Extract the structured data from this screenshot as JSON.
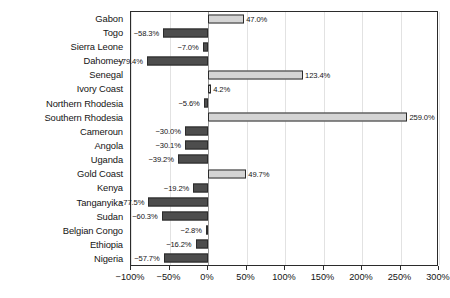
{
  "chart_data": {
    "type": "bar",
    "orientation": "horizontal",
    "title": "",
    "subtitle": "",
    "xlabel": "",
    "ylabel": "",
    "xlim": [
      -100,
      300
    ],
    "ylim": null,
    "grid": true,
    "legend": null,
    "legend_position": "none",
    "xticks": [
      -100,
      -50,
      0,
      50,
      100,
      150,
      200,
      250,
      300
    ],
    "xticklabels": [
      "−100%",
      "−50%",
      "0%",
      "50%",
      "100%",
      "150%",
      "200%",
      "250%",
      "300%"
    ],
    "zero_line": 0,
    "colors": {
      "positive_fill": "#d4d4d4",
      "negative_fill": "#4d4d4d",
      "bar_edge": "#2b2b2b",
      "gridline": "#e2e2e2",
      "zero_gridline": "#9a9a9a",
      "frame": "#2b2b2b",
      "text": "#141414",
      "background": "#ffffff"
    },
    "categories": [
      "Gabon",
      "Togo",
      "Sierra Leone",
      "Dahomey",
      "Senegal",
      "Ivory Coast",
      "Northern Rhodesia",
      "Southern Rhodesia",
      "Cameroun",
      "Angola",
      "Uganda",
      "Gold Coast",
      "Kenya",
      "Tanganyika",
      "Sudan",
      "Belgian Congo",
      "Ethiopia",
      "Nigeria"
    ],
    "values": [
      47.0,
      -58.3,
      -7.0,
      -79.4,
      123.4,
      4.2,
      -5.6,
      259.0,
      -30.0,
      -30.1,
      -39.2,
      49.7,
      -19.2,
      -77.5,
      -60.3,
      -2.8,
      -16.2,
      -57.7
    ],
    "value_labels": [
      "47.0%",
      "−58.3%",
      "−7.0%",
      "−79.4%",
      "123.4%",
      "4.2%",
      "−5.6%",
      "259.0%",
      "−30.0%",
      "−30.1%",
      "−39.2%",
      "49.7%",
      "−19.2%",
      "−77.5%",
      "−60.3%",
      "−2.8%",
      "−16.2%",
      "−57.7%"
    ]
  }
}
